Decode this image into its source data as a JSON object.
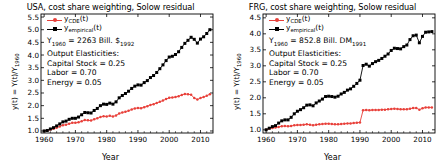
{
  "figure": {
    "width": 443,
    "height": 162,
    "background": "#ffffff"
  },
  "colors": {
    "empirical": "#000000",
    "cde": "#e8403a",
    "frame": "#000000",
    "text": "#000000"
  },
  "panels": [
    {
      "id": "usa",
      "title": "USA, cost share weighting, Solow residual",
      "xlabel": "Year",
      "ylabel_parts": {
        "pre": "y(t) = Y(t)/Y",
        "sub": "1960"
      },
      "legend": [
        {
          "name": "cde",
          "pre": "y",
          "sub": "CDE",
          "post": "(t)",
          "color": "#e8403a",
          "marker": "dot"
        },
        {
          "name": "empirical",
          "pre": "y",
          "sub": "empirical",
          "post": "(t)",
          "color": "#000000",
          "marker": "square"
        }
      ],
      "annotations": [
        {
          "pre": "Y",
          "sub": "1960",
          "mid": " = 2263 Bill. $",
          "sub2": "1992",
          "post": ""
        },
        {
          "pre": "Output Elasticities:",
          "sub": "",
          "mid": "",
          "sub2": "",
          "post": ""
        },
        {
          "pre": "Capital Stock = 0.25",
          "sub": "",
          "mid": "",
          "sub2": "",
          "post": ""
        },
        {
          "pre": "Labor = 0.70",
          "sub": "",
          "mid": "",
          "sub2": "",
          "post": ""
        },
        {
          "pre": "Energy = 0.05",
          "sub": "",
          "mid": "",
          "sub2": "",
          "post": ""
        }
      ],
      "xticks": [
        1960,
        1970,
        1980,
        1990,
        2000,
        2010
      ],
      "yticks": [
        1.0,
        1.5,
        2.0,
        2.5,
        3.0,
        3.5,
        4.0,
        4.5,
        5.0,
        5.5
      ],
      "ytick_labels": [
        "1.0",
        "1.5",
        "2.0",
        "2.5",
        "3.0",
        "3.5",
        "4.0",
        "4.5",
        "5.0",
        "5.5"
      ],
      "xlim": [
        1959,
        2014
      ],
      "ylim": [
        0.92,
        5.62
      ]
    },
    {
      "id": "frg",
      "title": "FRG, cost share weighting, Solow residual",
      "xlabel": "Year",
      "ylabel_parts": {
        "pre": "y(t) = Y(t)/Y",
        "sub": "1960"
      },
      "legend": [
        {
          "name": "cde",
          "pre": "y",
          "sub": "CDE",
          "post": "(t)",
          "color": "#e8403a",
          "marker": "dot"
        },
        {
          "name": "empirical",
          "pre": "y",
          "sub": "empirical",
          "post": "(t)",
          "color": "#000000",
          "marker": "square"
        }
      ],
      "annotations": [
        {
          "pre": "Y",
          "sub": "1960",
          "mid": " = 852.8 Bill. DM",
          "sub2": "1991",
          "post": ""
        },
        {
          "pre": "Output Elasticities:",
          "sub": "",
          "mid": "",
          "sub2": "",
          "post": ""
        },
        {
          "pre": "Capital Stock = 0.25",
          "sub": "",
          "mid": "",
          "sub2": "",
          "post": ""
        },
        {
          "pre": "Labor = 0.70",
          "sub": "",
          "mid": "",
          "sub2": "",
          "post": ""
        },
        {
          "pre": "Energy = 0.05",
          "sub": "",
          "mid": "",
          "sub2": "",
          "post": ""
        }
      ],
      "xticks": [
        1960,
        1970,
        1980,
        1990,
        2000,
        2010
      ],
      "yticks": [
        1.0,
        1.5,
        2.0,
        2.5,
        3.0,
        3.5,
        4.0,
        4.5
      ],
      "ytick_labels": [
        "1.0",
        "1.5",
        "2.0",
        "2.5",
        "3.0",
        "3.5",
        "4.0",
        "4.5"
      ],
      "xlim": [
        1959,
        2014
      ],
      "ylim": [
        0.9,
        4.62
      ]
    }
  ],
  "chart_data": [
    {
      "type": "line",
      "panel": "usa",
      "title": "USA, cost share weighting, Solow residual",
      "xlabel": "Year",
      "ylabel": "y(t) = Y(t)/Y_1960",
      "xlim": [
        1959,
        2014
      ],
      "ylim": [
        0.92,
        5.62
      ],
      "xticks": [
        1960,
        1970,
        1980,
        1990,
        2000,
        2010
      ],
      "yticks": [
        1.0,
        1.5,
        2.0,
        2.5,
        3.0,
        3.5,
        4.0,
        4.5,
        5.0,
        5.5
      ],
      "grid": false,
      "legend_position": "upper-left",
      "x": [
        1960,
        1961,
        1962,
        1963,
        1964,
        1965,
        1966,
        1967,
        1968,
        1969,
        1970,
        1971,
        1972,
        1973,
        1974,
        1975,
        1976,
        1977,
        1978,
        1979,
        1980,
        1981,
        1982,
        1983,
        1984,
        1985,
        1986,
        1987,
        1988,
        1989,
        1990,
        1991,
        1992,
        1993,
        1994,
        1995,
        1996,
        1997,
        1998,
        1999,
        2000,
        2001,
        2002,
        2003,
        2004,
        2005,
        2006,
        2007,
        2008,
        2009,
        2010,
        2011,
        2012,
        2013
      ],
      "series": [
        {
          "name": "y_empirical(t)",
          "color": "#000000",
          "marker": "square",
          "values": [
            1.0,
            1.02,
            1.08,
            1.13,
            1.2,
            1.28,
            1.36,
            1.39,
            1.46,
            1.5,
            1.5,
            1.55,
            1.64,
            1.73,
            1.72,
            1.71,
            1.81,
            1.89,
            2.0,
            2.06,
            2.05,
            2.1,
            2.06,
            2.15,
            2.31,
            2.4,
            2.48,
            2.57,
            2.68,
            2.77,
            2.82,
            2.81,
            2.91,
            2.99,
            3.11,
            3.19,
            3.31,
            3.46,
            3.61,
            3.78,
            3.92,
            3.95,
            4.02,
            4.13,
            4.3,
            4.46,
            4.58,
            4.7,
            4.62,
            4.47,
            4.63,
            4.72,
            4.85,
            5.0
          ]
        },
        {
          "name": "y_CDE(t)",
          "color": "#e8403a",
          "marker": "dot",
          "values": [
            1.0,
            1.02,
            1.06,
            1.09,
            1.13,
            1.18,
            1.23,
            1.25,
            1.29,
            1.32,
            1.32,
            1.34,
            1.38,
            1.43,
            1.42,
            1.41,
            1.46,
            1.5,
            1.55,
            1.58,
            1.57,
            1.6,
            1.57,
            1.61,
            1.69,
            1.73,
            1.76,
            1.8,
            1.85,
            1.89,
            1.91,
            1.9,
            1.94,
            1.98,
            2.03,
            2.06,
            2.1,
            2.15,
            2.2,
            2.26,
            2.31,
            2.32,
            2.34,
            2.37,
            2.42,
            2.46,
            2.45,
            2.43,
            2.3,
            2.24,
            2.3,
            2.34,
            2.39,
            2.45
          ]
        }
      ]
    },
    {
      "type": "line",
      "panel": "frg",
      "title": "FRG, cost share weighting, Solow residual",
      "xlabel": "Year",
      "ylabel": "y(t) = Y(t)/Y_1960",
      "xlim": [
        1959,
        2014
      ],
      "ylim": [
        0.9,
        4.62
      ],
      "xticks": [
        1960,
        1970,
        1980,
        1990,
        2000,
        2010
      ],
      "yticks": [
        1.0,
        1.5,
        2.0,
        2.5,
        3.0,
        3.5,
        4.0,
        4.5
      ],
      "grid": false,
      "legend_position": "upper-left",
      "note": "Discontinuity at 1990 due to German reunification",
      "x": [
        1960,
        1961,
        1962,
        1963,
        1964,
        1965,
        1966,
        1967,
        1968,
        1969,
        1970,
        1971,
        1972,
        1973,
        1974,
        1975,
        1976,
        1977,
        1978,
        1979,
        1980,
        1981,
        1982,
        1983,
        1984,
        1985,
        1986,
        1987,
        1988,
        1989,
        1990,
        1991,
        1992,
        1993,
        1994,
        1995,
        1996,
        1997,
        1998,
        1999,
        2000,
        2001,
        2002,
        2003,
        2004,
        2005,
        2006,
        2007,
        2008,
        2009,
        2010,
        2011,
        2012,
        2013
      ],
      "series": [
        {
          "name": "y_empirical(t)",
          "color": "#000000",
          "marker": "square",
          "values": [
            1.0,
            1.05,
            1.1,
            1.13,
            1.21,
            1.28,
            1.31,
            1.31,
            1.39,
            1.5,
            1.58,
            1.63,
            1.69,
            1.77,
            1.78,
            1.75,
            1.84,
            1.9,
            1.96,
            2.04,
            2.05,
            2.04,
            2.02,
            2.05,
            2.12,
            2.17,
            2.24,
            2.28,
            2.36,
            2.45,
            2.55,
            3.01,
            3.05,
            2.99,
            3.07,
            3.13,
            3.17,
            3.23,
            3.3,
            3.37,
            3.48,
            3.55,
            3.54,
            3.53,
            3.6,
            3.65,
            3.82,
            3.94,
            3.96,
            3.72,
            3.92,
            4.05,
            4.06,
            4.07
          ]
        },
        {
          "name": "y_CDE(t)",
          "color": "#e8403a",
          "marker": "dot",
          "values": [
            1.0,
            1.04,
            1.06,
            1.07,
            1.09,
            1.11,
            1.12,
            1.11,
            1.12,
            1.14,
            1.15,
            1.15,
            1.16,
            1.17,
            1.16,
            1.14,
            1.16,
            1.17,
            1.18,
            1.19,
            1.19,
            1.18,
            1.17,
            1.17,
            1.18,
            1.19,
            1.2,
            1.2,
            1.21,
            1.22,
            1.23,
            1.61,
            1.62,
            1.61,
            1.62,
            1.62,
            1.62,
            1.63,
            1.63,
            1.64,
            1.65,
            1.66,
            1.65,
            1.64,
            1.64,
            1.64,
            1.66,
            1.68,
            1.68,
            1.63,
            1.67,
            1.7,
            1.7,
            1.7
          ]
        }
      ]
    }
  ]
}
